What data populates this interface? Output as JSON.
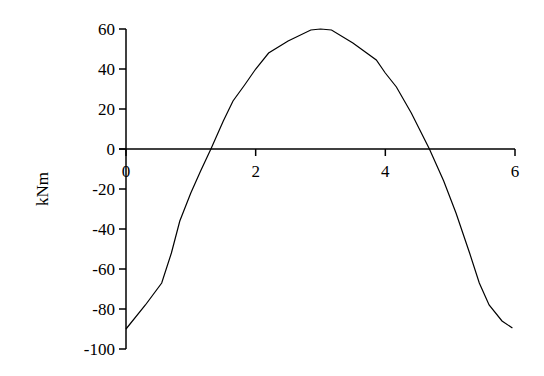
{
  "chart_data": {
    "type": "line",
    "title": "",
    "xlabel": "",
    "ylabel": "kNm",
    "xlim": [
      0,
      6
    ],
    "ylim": [
      -100,
      60
    ],
    "xticks": [
      "0",
      "2",
      "4",
      "6"
    ],
    "yticks": [
      "60",
      "40",
      "20",
      "0",
      "-20",
      "-40",
      "-60",
      "-80",
      "-100"
    ],
    "grid": false,
    "legend": null,
    "series": [
      {
        "name": "Bending moment",
        "color": "#000000",
        "x": [
          0,
          0.3,
          0.55,
          0.7,
          0.83,
          1.0,
          1.15,
          1.31,
          1.5,
          1.65,
          1.83,
          2.0,
          2.2,
          2.5,
          2.85,
          3.0,
          3.17,
          3.5,
          3.86,
          4.0,
          4.17,
          4.4,
          4.68,
          4.9,
          5.09,
          5.3,
          5.45,
          5.6,
          5.8,
          5.96
        ],
        "y": [
          -90,
          -78,
          -67,
          -52,
          -36,
          -22,
          -11,
          0,
          14,
          24,
          32,
          40,
          48,
          54,
          59.5,
          60,
          59.5,
          53,
          44.5,
          38,
          31,
          18,
          0,
          -16,
          -32,
          -52,
          -67,
          -78,
          -86,
          -89.5
        ]
      }
    ]
  }
}
